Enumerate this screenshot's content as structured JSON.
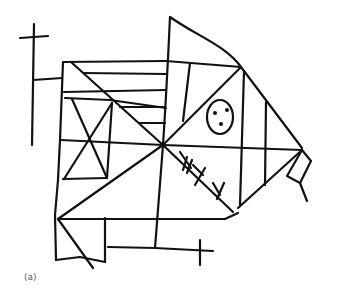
{
  "figure": {
    "caption": "(a)",
    "stroke_color": "#111111",
    "background_color": "#ffffff"
  }
}
